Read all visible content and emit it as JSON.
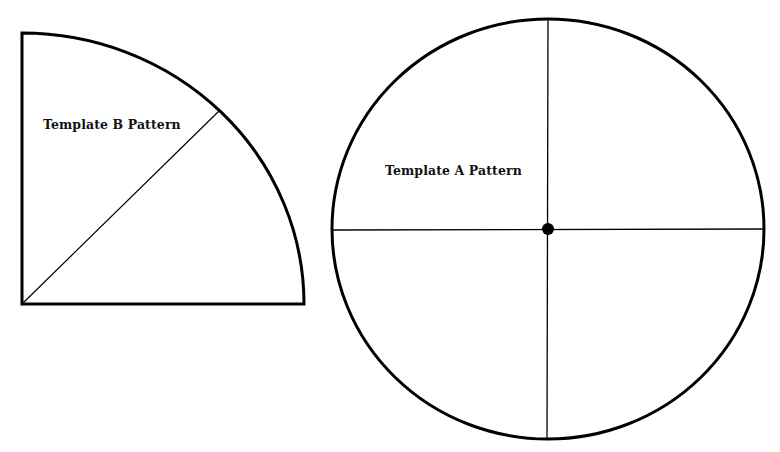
{
  "templates": {
    "b": {
      "label": "Template B Pattern",
      "shape": "quarter-circle",
      "corner": [
        22,
        304
      ],
      "radius_x": 282,
      "radius_y": 271,
      "diagonal_end": [
        219,
        111
      ]
    },
    "a": {
      "label": "Template A Pattern",
      "shape": "circle",
      "center": [
        548,
        229
      ],
      "radius_x": 216,
      "radius_y": 210,
      "center_dot_radius": 6
    }
  },
  "colors": {
    "stroke": "#000000",
    "background": "#ffffff",
    "text": "#111111"
  }
}
